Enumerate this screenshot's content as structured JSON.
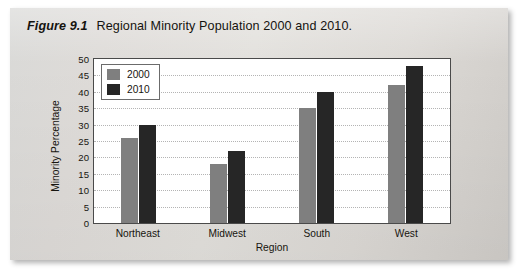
{
  "figure": {
    "number": "Figure 9.1",
    "caption": "Regional Minority Population 2000 and 2010."
  },
  "chart_data": {
    "type": "bar",
    "title": "Regional Minority Population 2000 and 2010.",
    "xlabel": "Region",
    "ylabel": "Minority Percentage",
    "categories": [
      "Northeast",
      "Midwest",
      "South",
      "West"
    ],
    "series": [
      {
        "name": "2000",
        "color": "#7f7f7f",
        "values": [
          26,
          18,
          35,
          42
        ]
      },
      {
        "name": "2010",
        "color": "#262626",
        "values": [
          30,
          22,
          40,
          48
        ]
      }
    ],
    "ylim": [
      0,
      50
    ],
    "ytick_step": 5,
    "yticks": [
      "50",
      "45",
      "40",
      "35",
      "30",
      "25",
      "20",
      "15",
      "10",
      "5",
      "0"
    ],
    "grid": true,
    "grid_axis": "y",
    "legend_position": "upper-left-inside"
  }
}
